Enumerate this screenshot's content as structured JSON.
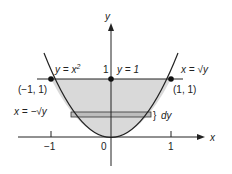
{
  "figure": {
    "axes": {
      "x_label": "x",
      "y_label": "y",
      "x_ticks": [
        "−1",
        "0",
        "1"
      ],
      "y_tick": "1"
    },
    "curves": {
      "parabola_label": "y = x²",
      "parabola_label_main": "y = x",
      "parabola_label_exp": "2",
      "line_label": "y = 1",
      "right_branch_label": "x = √y",
      "left_branch_label": "x = −√y"
    },
    "points": [
      {
        "label": "(−1, 1)",
        "x": -1,
        "y": 1
      },
      {
        "label": "(0, 1)",
        "x": 0,
        "y": 1
      },
      {
        "label": "(1, 1)",
        "x": 1,
        "y": 1
      }
    ],
    "strip": {
      "label": "dy"
    },
    "colors": {
      "shade": "#d9d9d9",
      "strip": "#bdbdbd",
      "ink": "#222222"
    }
  }
}
